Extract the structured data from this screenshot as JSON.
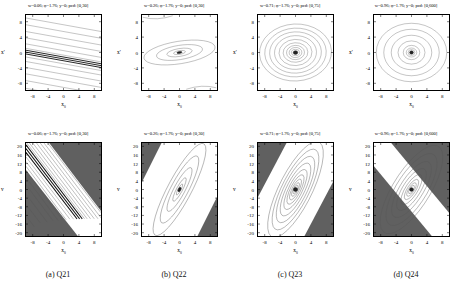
{
  "figure": {
    "panel_columns": 4,
    "panel_rows": 2,
    "background_color": "#ffffff",
    "shaded_region_color": "#606060",
    "contour_color": "#555555",
    "axis_color": "#000000"
  },
  "captions": [
    {
      "label": "(a) Q21"
    },
    {
      "label": "(b) Q22"
    },
    {
      "label": "(c) Q23"
    },
    {
      "label": "(d) Q24"
    }
  ],
  "panels": {
    "top": [
      {
        "title": "w=0.06; φ=1.76; y=0; pcd: [0,30]"
      },
      {
        "title": "w=0.26; φ=1.76; y=0; pcd: [0,30]"
      },
      {
        "title": "w=0.71; φ=1.76; y=0; pcd: [0,75]"
      },
      {
        "title": "w=0.96; φ=1.76; y=0; pcd: [0,600]"
      }
    ],
    "bottom": [
      {
        "title": "w=0.06; φ=1.76; y=0; pcd: [0,30]"
      },
      {
        "title": "w=0.26; φ=1.76; y=0; pcd: [0,30]"
      },
      {
        "title": "w=0.71; φ=1.76; y=0; pcd: [0,75]"
      },
      {
        "title": "w=0.96; φ=1.76; y=0; pcd: [0,600]"
      }
    ]
  },
  "axes": {
    "top": {
      "xlabel": "x",
      "xlabel_sub": "0",
      "ylabel": "x'",
      "ylabel_sub": "",
      "xticks": [
        "-8",
        "-4",
        "0",
        "4",
        "8"
      ],
      "xtick_values": [
        -8,
        -4,
        0,
        4,
        8
      ],
      "yticks": [
        "8",
        "4",
        "0",
        "-4",
        "-8"
      ],
      "ytick_values": [
        8,
        4,
        0,
        -4,
        -8
      ],
      "xlim": [
        -10,
        10
      ],
      "ylim": [
        -10,
        10
      ]
    },
    "bottom": {
      "xlabel": "x",
      "xlabel_sub": "0",
      "ylabel": "v",
      "ylabel_sub": "",
      "xticks": [
        "-8",
        "-4",
        "0",
        "4",
        "8"
      ],
      "xtick_values": [
        -8,
        -4,
        0,
        4,
        8
      ],
      "yticks": [
        "20",
        "16",
        "12",
        "8",
        "4",
        "0",
        "-4",
        "-8",
        "-12",
        "-16",
        "-20"
      ],
      "ytick_values": [
        20,
        16,
        12,
        8,
        4,
        0,
        -4,
        -8,
        -12,
        -16,
        -20
      ],
      "xlim": [
        -10,
        10
      ],
      "ylim": [
        -22,
        22
      ]
    }
  },
  "chart_data": [
    {
      "type": "line",
      "panel": "a-top",
      "title": "w=0.06; φ=1.76; y=0; pcd: [0,30]",
      "xlabel": "x0",
      "ylabel": "x'",
      "xlim": [
        -10,
        10
      ],
      "ylim": [
        -10,
        10
      ],
      "grid": false,
      "legend": null,
      "description": "Nearly horizontal, slightly negatively tilted parallel contour lines; dense black saturated band at x'=0",
      "contour_shape": "open parallel lines",
      "tilt_slope": -0.18,
      "line_intercepts": [
        9.2,
        7.4,
        5.6,
        3.9,
        2.3,
        1.1,
        0.45,
        0.0,
        -0.45,
        -1.1,
        -2.3,
        -3.9,
        -5.6,
        -7.4,
        -9.2
      ],
      "dense_band_halfwidth": 0.7
    },
    {
      "type": "line",
      "panel": "b-top",
      "title": "w=0.26; φ=1.76; y=0; pcd: [0,30]",
      "xlabel": "x0",
      "ylabel": "x'",
      "xlim": [
        -10,
        10
      ],
      "ylim": [
        -10,
        10
      ],
      "grid": false,
      "legend": null,
      "description": "Nested elongated ellipses tilted slightly clockwise, centered at origin, with dense core",
      "contour_shape": "closed nested ellipses",
      "center": [
        0,
        0
      ],
      "tilt_deg": -9,
      "semi_axes_a": [
        9.6,
        6.2,
        3.4,
        1.6,
        0.7
      ],
      "semi_axes_b": [
        3.0,
        1.9,
        1.05,
        0.5,
        0.22
      ]
    },
    {
      "type": "line",
      "panel": "c-top",
      "title": "w=0.71; φ=1.76; y=0; pcd: [0,75]",
      "xlabel": "x0",
      "ylabel": "x'",
      "xlim": [
        -10,
        10
      ],
      "ylim": [
        -10,
        10
      ],
      "grid": false,
      "legend": null,
      "description": "Many nested near-circular ellipses centered at origin, slightly wider than tall, dense dark core",
      "contour_shape": "closed nested ellipses",
      "center": [
        0,
        0
      ],
      "tilt_deg": -3,
      "semi_axes_a": [
        9.6,
        8.2,
        6.9,
        5.6,
        4.4,
        3.3,
        2.4,
        1.7,
        1.1,
        0.65,
        0.3
      ],
      "semi_axes_b": [
        7.6,
        6.5,
        5.5,
        4.5,
        3.5,
        2.6,
        1.9,
        1.35,
        0.85,
        0.5,
        0.24
      ]
    },
    {
      "type": "line",
      "panel": "d-top",
      "title": "w=0.96; φ=1.76; y=0; pcd: [0,600]",
      "xlabel": "x0",
      "ylabel": "x'",
      "xlim": [
        -10,
        10
      ],
      "ylim": [
        -10,
        10
      ],
      "grid": false,
      "legend": null,
      "description": "Nested near-circular contours centered at origin with compact dense core",
      "contour_shape": "closed nested ellipses",
      "center": [
        0,
        0
      ],
      "tilt_deg": 0,
      "semi_axes_a": [
        9.4,
        7.4,
        5.4,
        3.6,
        2.2,
        1.4,
        0.9,
        0.55,
        0.3
      ],
      "semi_axes_b": [
        7.8,
        6.2,
        4.6,
        3.1,
        1.9,
        1.2,
        0.78,
        0.48,
        0.26
      ]
    },
    {
      "type": "line",
      "panel": "a-bottom",
      "title": "w=0.06; φ=1.76; y=0; pcd: [0,30]",
      "xlabel": "x0",
      "ylabel": "v",
      "xlim": [
        -10,
        10
      ],
      "ylim": [
        -22,
        22
      ],
      "grid": false,
      "legend": null,
      "description": "Diagonal white band running upper-left to lower-right containing dense parallel contours and a saturated black stripe; dark gray shading fills upper-right and lower-left regions",
      "contour_shape": "open parallel diagonal lines",
      "band_slope": -2.05,
      "band_halfwidth_v": 13.5,
      "shaded_color": "#606060",
      "line_offsets": [
        12.2,
        10.0,
        8.0,
        6.2,
        4.6,
        3.1,
        1.9,
        0.9,
        0.0,
        -0.9,
        -1.9,
        -3.1,
        -4.6,
        -6.2,
        -8.0,
        -10.0,
        -12.2
      ]
    },
    {
      "type": "line",
      "panel": "b-bottom",
      "title": "w=0.26; φ=1.76; y=0; pcd: [0,30]",
      "xlabel": "x0",
      "ylabel": "v",
      "xlim": [
        -10,
        10
      ],
      "ylim": [
        -22,
        22
      ],
      "grid": false,
      "legend": null,
      "description": "Nested elongated ellipses tilted along the diagonal band; dark gray shading in upper-left and lower-right corners",
      "contour_shape": "closed nested ellipses",
      "center": [
        0,
        0
      ],
      "tilt_deg": 62,
      "semi_axes_a": [
        19.0,
        13.0,
        7.6,
        3.6,
        1.4
      ],
      "semi_axes_b": [
        4.6,
        3.2,
        1.85,
        0.9,
        0.35
      ],
      "shaded_color": "#606060",
      "band_slope": 2.2,
      "band_halfwidth_v": 20.0
    },
    {
      "type": "line",
      "panel": "c-bottom",
      "title": "w=0.71; φ=1.76; y=0; pcd: [0,75]",
      "xlabel": "x0",
      "ylabel": "v",
      "xlim": [
        -10,
        10
      ],
      "ylim": [
        -22,
        22
      ],
      "grid": false,
      "legend": null,
      "description": "Many nested ellipses tilted along the diagonal, dense dark core at origin; dark gray shading in upper-left and lower-right corners",
      "contour_shape": "closed nested ellipses",
      "center": [
        0,
        0
      ],
      "tilt_deg": 55,
      "semi_axes_a": [
        19.5,
        16.5,
        13.5,
        10.8,
        8.2,
        6.0,
        4.2,
        2.8,
        1.7,
        0.9
      ],
      "semi_axes_b": [
        6.6,
        5.6,
        4.6,
        3.7,
        2.8,
        2.0,
        1.4,
        0.95,
        0.58,
        0.3
      ],
      "shaded_color": "#606060",
      "band_slope": 2.4,
      "band_halfwidth_v": 21.0
    },
    {
      "type": "line",
      "panel": "d-bottom",
      "title": "w=0.96; φ=1.76; y=0; pcd: [0,600]",
      "xlabel": "x0",
      "ylabel": "v",
      "xlim": [
        -10,
        10
      ],
      "ylim": [
        -22,
        22
      ],
      "grid": false,
      "legend": null,
      "description": "Nested ellipses tilted along a steeper diagonal with compact dense core; large dark gray regions in upper-right and lower-left",
      "contour_shape": "closed nested ellipses",
      "center": [
        0,
        0
      ],
      "tilt_deg": 50,
      "semi_axes_a": [
        19.0,
        15.5,
        12.0,
        9.0,
        6.4,
        4.4,
        2.9,
        1.8,
        1.0
      ],
      "semi_axes_b": [
        7.4,
        6.1,
        4.7,
        3.5,
        2.5,
        1.7,
        1.15,
        0.7,
        0.4
      ],
      "shaded_color": "#606060",
      "band_slope": -2.6,
      "band_halfwidth_v": 22.0
    }
  ]
}
